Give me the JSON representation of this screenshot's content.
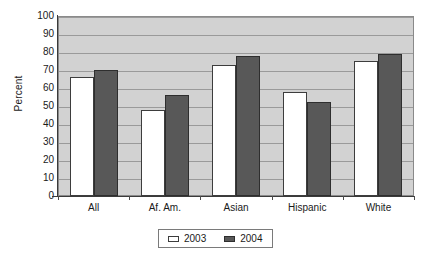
{
  "chart_data": {
    "type": "bar",
    "title": "",
    "xlabel": "",
    "ylabel": "Percent",
    "ylim": [
      0,
      100
    ],
    "ytick_step": 10,
    "yticks": [
      100,
      90,
      80,
      70,
      60,
      50,
      40,
      30,
      20,
      10,
      0
    ],
    "grid": true,
    "legend_position": "bottom-center",
    "categories": [
      "All",
      "Af. Am.",
      "Asian",
      "Hispanic",
      "White"
    ],
    "series": [
      {
        "name": "2003",
        "color": "#ffffff",
        "values": [
          66,
          48,
          73,
          58,
          75
        ]
      },
      {
        "name": "2004",
        "color": "#585858",
        "values": [
          70,
          56,
          78,
          52,
          79
        ]
      }
    ]
  },
  "style": {
    "plot_background": "#d2d2d2",
    "gridline_color": "#9a9a9a",
    "axis_color": "#3a3a3a",
    "bar_border": "#3d3d3d",
    "text_color": "#1a1a1a",
    "legend_border": "#7a7a7a"
  }
}
